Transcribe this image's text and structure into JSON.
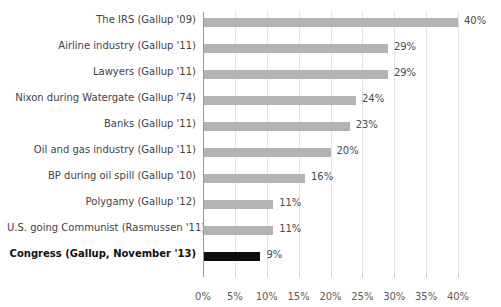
{
  "chart_data": {
    "type": "bar",
    "orientation": "horizontal",
    "title": "",
    "xlabel": "",
    "ylabel": "",
    "xlim": [
      0,
      40
    ],
    "xticks": [
      "0%",
      "5%",
      "10%",
      "15%",
      "20%",
      "25%",
      "30%",
      "35%",
      "40%"
    ],
    "xtick_values": [
      0,
      5,
      10,
      15,
      20,
      25,
      30,
      35,
      40
    ],
    "grid": true,
    "legend": "none",
    "categories": [
      "The IRS (Gallup '09)",
      "Airline industry (Gallup '11)",
      "Lawyers (Gallup '11)",
      "Nixon during Watergate (Gallup '74)",
      "Banks (Gallup '11)",
      "Oil and gas industry (Gallup '11)",
      "BP during oil spill (Gallup '10)",
      "Polygamy (Gallup '12)",
      "U.S. going Communist (Rasmussen '11)",
      "Congress (Gallup, November '13)"
    ],
    "values": [
      40,
      29,
      29,
      24,
      23,
      20,
      16,
      11,
      11,
      9
    ],
    "value_labels": [
      "40%",
      "29%",
      "29%",
      "24%",
      "23%",
      "20%",
      "16%",
      "11%",
      "11%",
      "9%"
    ],
    "highlight_index": 9,
    "colors": {
      "bar": "#b3b3b3",
      "bar_highlight": "#0d0d0d",
      "gridline": "#e2e2e2",
      "axis": "#9a9a9a",
      "text": "#3f3f3f",
      "background": "#ffffff"
    }
  }
}
